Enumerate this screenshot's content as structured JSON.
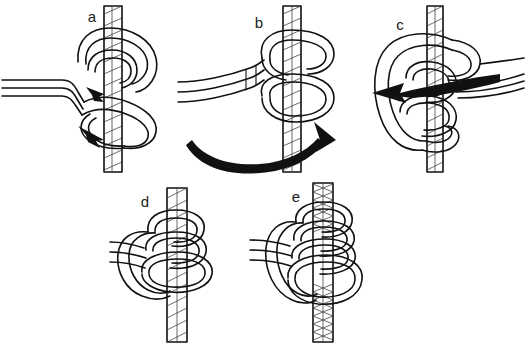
{
  "figure": {
    "background_color": "#ffffff",
    "ink_color": "#111111",
    "width": 525,
    "height": 349,
    "panel_count": 5
  },
  "panels": [
    {
      "id": "a",
      "label": "a",
      "label_x": 92,
      "label_y": 22,
      "caption": "Step a",
      "has_arrow": true,
      "arrow_count": 2,
      "arrow_style": "straight-barbed",
      "arrow_direction": "down-right",
      "standing_rope_orientation": "vertical",
      "working_end_side": "left"
    },
    {
      "id": "b",
      "label": "b",
      "label_x": 259,
      "label_y": 28,
      "caption": "Step b",
      "has_arrow": true,
      "arrow_count": 1,
      "arrow_style": "curved-sweep",
      "arrow_direction": "counter-clockwise-to-right",
      "standing_rope_orientation": "vertical",
      "working_end_side": "left"
    },
    {
      "id": "c",
      "label": "c",
      "label_x": 400,
      "label_y": 30,
      "caption": "Step c",
      "has_arrow": true,
      "arrow_count": 1,
      "arrow_style": "tapered-barbed",
      "arrow_direction": "left",
      "standing_rope_orientation": "vertical",
      "working_end_side": "right"
    },
    {
      "id": "d",
      "label": "d",
      "label_x": 145,
      "label_y": 207,
      "caption": "Step d",
      "has_arrow": false,
      "arrow_count": 0,
      "arrow_style": "none",
      "arrow_direction": "none",
      "standing_rope_orientation": "vertical",
      "working_end_side": "left"
    },
    {
      "id": "e",
      "label": "e",
      "label_x": 296,
      "label_y": 202,
      "caption": "Step e",
      "has_arrow": false,
      "arrow_count": 0,
      "arrow_style": "none",
      "arrow_direction": "none",
      "standing_rope_orientation": "vertical",
      "working_end_side": "left"
    }
  ]
}
